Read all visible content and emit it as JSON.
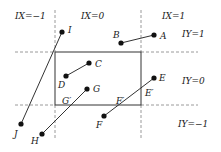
{
  "diagram": {
    "title": "",
    "colors": {
      "stroke": "#333333",
      "dashed": "#9a9a9a",
      "point": "#111111",
      "background": "#ffffff"
    },
    "viewport_rect": {
      "x1": 55,
      "y1": 52,
      "x2": 141,
      "y2": 105
    },
    "dashed_lines": [
      {
        "id": "h-top",
        "x1": 15,
        "y1": 52,
        "x2": 55,
        "y2": 52
      },
      {
        "id": "h-top-right",
        "x1": 141,
        "y1": 52,
        "x2": 198,
        "y2": 52
      },
      {
        "id": "h-bottom-left",
        "x1": 15,
        "y1": 105,
        "x2": 55,
        "y2": 105
      },
      {
        "id": "h-bottom-right",
        "x1": 141,
        "y1": 105,
        "x2": 198,
        "y2": 105
      },
      {
        "id": "v-left-top",
        "x1": 55,
        "y1": 10,
        "x2": 55,
        "y2": 52
      },
      {
        "id": "v-left-bottom",
        "x1": 55,
        "y1": 105,
        "x2": 55,
        "y2": 140
      },
      {
        "id": "v-right-top",
        "x1": 141,
        "y1": 10,
        "x2": 141,
        "y2": 52
      },
      {
        "id": "v-right-bottom",
        "x1": 141,
        "y1": 105,
        "x2": 141,
        "y2": 140
      }
    ],
    "region_labels": [
      {
        "text": "IX=−1",
        "x": 15,
        "y": 19
      },
      {
        "text": "IX=0",
        "x": 81,
        "y": 19
      },
      {
        "text": "IX=1",
        "x": 162,
        "y": 19
      },
      {
        "text": "IY=1",
        "x": 182,
        "y": 37
      },
      {
        "text": "IY=0",
        "x": 182,
        "y": 84
      },
      {
        "text": "IY=−1",
        "x": 178,
        "y": 127
      }
    ],
    "segments": [
      {
        "from": "A",
        "to": "B"
      },
      {
        "from": "C",
        "to": "D"
      },
      {
        "from": "E",
        "to": "F"
      },
      {
        "from": "G",
        "to": "H"
      },
      {
        "from": "I",
        "to": "J"
      }
    ],
    "points": [
      {
        "name": "A",
        "x": 154,
        "y": 35,
        "lx": 160,
        "ly": 39
      },
      {
        "name": "B",
        "x": 121,
        "y": 43,
        "lx": 113,
        "ly": 38
      },
      {
        "name": "C",
        "x": 89,
        "y": 63,
        "lx": 95,
        "ly": 67
      },
      {
        "name": "D",
        "x": 66,
        "y": 76,
        "lx": 58,
        "ly": 88
      },
      {
        "name": "E",
        "x": 154,
        "y": 78,
        "lx": 159,
        "ly": 81
      },
      {
        "name": "F",
        "x": 104,
        "y": 116,
        "lx": 96,
        "ly": 128
      },
      {
        "name": "G",
        "x": 87,
        "y": 89,
        "lx": 93,
        "ly": 92
      },
      {
        "name": "H",
        "x": 42,
        "y": 134,
        "lx": 31,
        "ly": 144
      },
      {
        "name": "I",
        "x": 62,
        "y": 32,
        "lx": 68,
        "ly": 33
      },
      {
        "name": "J",
        "x": 21,
        "y": 124,
        "lx": 14,
        "ly": 137
      }
    ],
    "intersection_labels": [
      {
        "text": "E′",
        "x": 145,
        "y": 96
      },
      {
        "text": "F′",
        "x": 116,
        "y": 104
      },
      {
        "text": "G′",
        "x": 62,
        "y": 104
      }
    ]
  }
}
